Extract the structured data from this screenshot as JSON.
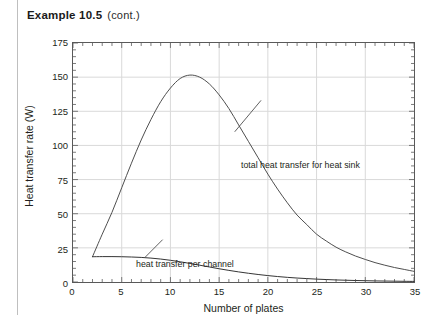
{
  "header": {
    "title": "Example 10.5",
    "continued": "(cont.)"
  },
  "figure": {
    "annotations": {
      "total": "total heat transfer for heat sink",
      "channel": "heat transfer per channel"
    }
  },
  "chart_data": {
    "type": "line",
    "title": "",
    "xlabel": "Number of plates",
    "ylabel": "Heat transfer rate (W)",
    "xlim": [
      0,
      35
    ],
    "ylim": [
      0,
      175
    ],
    "xticks": [
      0,
      5,
      10,
      15,
      20,
      25,
      30,
      35
    ],
    "yticks": [
      0,
      25,
      50,
      75,
      100,
      125,
      150,
      175
    ],
    "grid": true,
    "legend": "annotations-inline",
    "minor_ticks": true,
    "series": [
      {
        "name": "total heat transfer for heat sink",
        "color": "#4d4d4d",
        "x": [
          2,
          3,
          4,
          5,
          6,
          7,
          8,
          9,
          10,
          11,
          12,
          13,
          14,
          15,
          16,
          17,
          18,
          19,
          20,
          21,
          22,
          23,
          24,
          25,
          26,
          27,
          28,
          29,
          30,
          31,
          32,
          33,
          34,
          35
        ],
        "y": [
          18.5,
          35,
          51,
          69,
          87,
          104,
          119,
          132,
          142,
          149,
          151.5,
          150,
          145,
          137,
          127,
          115,
          103,
          91,
          79,
          68,
          58,
          49,
          42,
          35,
          30,
          25.5,
          22,
          19,
          16.5,
          14.2,
          12.3,
          10.6,
          9.2,
          7.8
        ]
      },
      {
        "name": "heat transfer per channel",
        "color": "#333333",
        "x": [
          2,
          3,
          4,
          5,
          6,
          7,
          8,
          9,
          10,
          11,
          12,
          13,
          14,
          15,
          16,
          17,
          18,
          19,
          20,
          21,
          22,
          23,
          24,
          25,
          26,
          27,
          28,
          29,
          30,
          31,
          32,
          33,
          34,
          35
        ],
        "y": [
          18.5,
          18.6,
          18.6,
          18.5,
          18.3,
          18.0,
          17.5,
          16.8,
          15.9,
          14.8,
          13.6,
          12.3,
          11.0,
          9.7,
          8.5,
          7.4,
          6.4,
          5.5,
          4.7,
          4.0,
          3.4,
          2.9,
          2.5,
          2.1,
          1.8,
          1.5,
          1.3,
          1.1,
          0.95,
          0.8,
          0.7,
          0.6,
          0.5,
          0.45
        ]
      }
    ],
    "annotation_leaders": [
      {
        "label": "total heat transfer for heat sink",
        "tip_x": 16.6,
        "tip_y": 110,
        "text_x": 19.3,
        "text_y": 133
      },
      {
        "label": "heat transfer per channel",
        "tip_x": 7.4,
        "tip_y": 18.1,
        "text_x": 9.2,
        "text_y": 31
      }
    ]
  },
  "colors": {
    "axis": "#595959",
    "grid": "#d9d9d9",
    "text": "#231f20",
    "margin_rule": "#bfbfbf"
  }
}
